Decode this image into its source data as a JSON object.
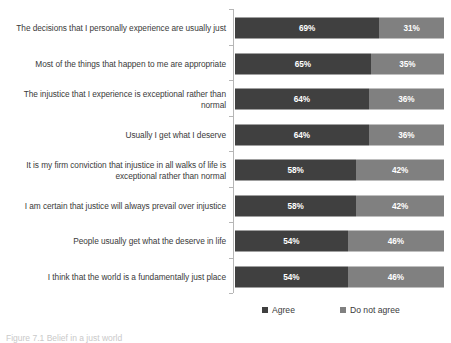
{
  "chart_data": {
    "type": "bar",
    "orientation": "horizontal",
    "stacked": true,
    "normalized_percent": true,
    "title": "",
    "subtitle": "",
    "xlabel": "",
    "ylabel": "",
    "xlim": [
      0,
      100
    ],
    "grid": false,
    "legend_position": "bottom",
    "value_suffix": "%",
    "categories": [
      "The decisions that I personally experience are usually just",
      "Most of the things that happen to me are appropriate",
      "The injustice that I experience is exceptional rather than normal",
      "Usually I get what I deserve",
      "It is my firm conviction that injustice in all walks of life is exceptional rather than normal",
      "I am certain that justice will always prevail over injustice",
      "People usually get what the deserve in life",
      "I think that the world is a fundamentally just place"
    ],
    "series": [
      {
        "name": "Agree",
        "color": "#404040",
        "values": [
          69,
          65,
          64,
          64,
          58,
          58,
          54,
          54
        ],
        "labels": [
          "69%",
          "65%",
          "64%",
          "64%",
          "58%",
          "58%",
          "54%",
          "54%"
        ]
      },
      {
        "name": "Do not agree",
        "color": "#808080",
        "values": [
          31,
          35,
          36,
          36,
          42,
          42,
          46,
          46
        ],
        "labels": [
          "31%",
          "35%",
          "36%",
          "36%",
          "42%",
          "42%",
          "46%",
          "46%"
        ]
      }
    ]
  },
  "legend": {
    "items": [
      {
        "label": "Agree",
        "color": "#404040"
      },
      {
        "label": "Do not agree",
        "color": "#808080"
      }
    ]
  },
  "caption": {
    "text": "Figure 7.1 Belief in a just world"
  }
}
